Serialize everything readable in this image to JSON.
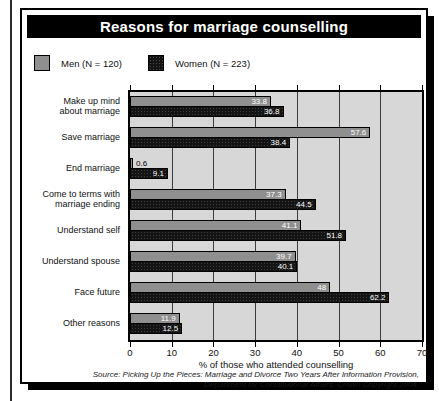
{
  "page": {
    "title_bar": "Reasons for marriage counselling",
    "source_line": "Source: Picking Up the Pieces: Marriage and Divorce Two Years After Information Provision, Department for Constitutional Affairs. Crown Copyright 2004."
  },
  "legend": {
    "men_label": "Men (N = 120)",
    "women_label": "Women (N = 223)"
  },
  "colors": {
    "men_bar": "#8f8f8f",
    "women_bar": "#141414",
    "plot_background": "#d7d7d7",
    "gridline": "#3c3c3c",
    "title_background": "#000000",
    "title_text": "#ffffff"
  },
  "chart_data": {
    "type": "bar",
    "orientation": "horizontal",
    "title": "Reasons for marriage counselling",
    "categories": [
      "Make up mind\nabout marriage",
      "Save marriage",
      "End marriage",
      "Come to terms with\nmarriage ending",
      "Understand self",
      "Understand spouse",
      "Face future",
      "Other reasons"
    ],
    "series": [
      {
        "name": "Men (N = 120)",
        "values": [
          33.8,
          57.6,
          0.6,
          37.3,
          41.1,
          39.7,
          48,
          11.9
        ]
      },
      {
        "name": "Women (N = 223)",
        "values": [
          36.8,
          38.4,
          9.1,
          44.5,
          51.8,
          40.1,
          62.2,
          12.5
        ]
      }
    ],
    "xlabel": "% of those who attended counselling",
    "xlim": [
      0,
      70
    ],
    "xticks": [
      0,
      10,
      20,
      30,
      40,
      50,
      60,
      70
    ],
    "grid": true,
    "value_labels": true,
    "legend_position": "top-left"
  }
}
